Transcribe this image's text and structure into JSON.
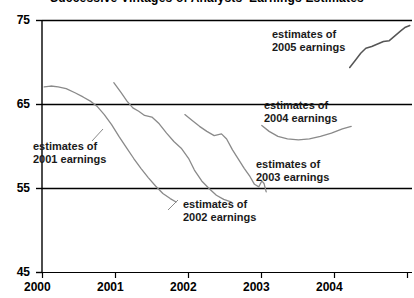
{
  "chart_data": {
    "type": "line",
    "title": "Successive Vintages of Analysts' Earnings Estimates",
    "xlabel": "",
    "ylabel": "",
    "xlim": [
      2000.0,
      2005.05
    ],
    "ylim": [
      45,
      75
    ],
    "y_ticks": [
      45,
      55,
      65,
      75
    ],
    "x_ticks": [
      "2000",
      "2001",
      "2002",
      "2003",
      "2004"
    ],
    "x_tick_values": [
      2000,
      2001,
      2002,
      2003,
      2004
    ],
    "grid": "horizontal gridlines at 55, 65, 75",
    "legend": "inline annotations",
    "series": [
      {
        "name": "estimates of 2001 earnings",
        "label": "estimates of\n2001 earnings",
        "points": [
          [
            2000.03,
            67.1
          ],
          [
            2000.12,
            67.2
          ],
          [
            2000.22,
            67.1
          ],
          [
            2000.33,
            66.9
          ],
          [
            2000.45,
            66.4
          ],
          [
            2000.56,
            65.9
          ],
          [
            2000.66,
            65.4
          ],
          [
            2000.75,
            64.8
          ],
          [
            2000.85,
            63.8
          ],
          [
            2000.95,
            62.6
          ],
          [
            2001.05,
            61.2
          ],
          [
            2001.15,
            59.9
          ],
          [
            2001.25,
            58.6
          ],
          [
            2001.35,
            57.4
          ],
          [
            2001.45,
            56.3
          ],
          [
            2001.55,
            55.3
          ],
          [
            2001.65,
            54.4
          ],
          [
            2001.75,
            53.8
          ],
          [
            2001.83,
            53.4
          ]
        ]
      },
      {
        "name": "estimates of 2002 earnings",
        "label": "estimates of\n2002 earnings",
        "points": [
          [
            2000.98,
            67.6
          ],
          [
            2001.08,
            66.4
          ],
          [
            2001.16,
            65.4
          ],
          [
            2001.24,
            64.6
          ],
          [
            2001.32,
            64.2
          ],
          [
            2001.4,
            63.7
          ],
          [
            2001.5,
            63.5
          ],
          [
            2001.6,
            62.7
          ],
          [
            2001.7,
            61.6
          ],
          [
            2001.8,
            60.6
          ],
          [
            2001.9,
            59.8
          ],
          [
            2002.0,
            58.6
          ],
          [
            2002.08,
            57.2
          ],
          [
            2002.18,
            55.9
          ],
          [
            2002.28,
            55.0
          ],
          [
            2002.38,
            54.2
          ],
          [
            2002.48,
            53.7
          ],
          [
            2002.58,
            53.4
          ]
        ]
      },
      {
        "name": "estimates of 2003 earnings",
        "label": "estimates of\n2003 earnings",
        "points": [
          [
            2001.95,
            63.8
          ],
          [
            2002.05,
            63.1
          ],
          [
            2002.15,
            62.4
          ],
          [
            2002.25,
            61.8
          ],
          [
            2002.35,
            61.3
          ],
          [
            2002.45,
            61.5
          ],
          [
            2002.52,
            60.9
          ],
          [
            2002.6,
            59.6
          ],
          [
            2002.68,
            58.5
          ],
          [
            2002.76,
            57.4
          ],
          [
            2002.84,
            56.4
          ],
          [
            2002.9,
            55.5
          ],
          [
            2002.96,
            55.2
          ],
          [
            2003.0,
            55.9
          ],
          [
            2003.03,
            55.6
          ],
          [
            2003.06,
            54.6
          ]
        ]
      },
      {
        "name": "estimates of 2004 earnings",
        "label": "estimates of\n2004 earnings",
        "points": [
          [
            2003.0,
            62.5
          ],
          [
            2003.1,
            61.8
          ],
          [
            2003.22,
            61.2
          ],
          [
            2003.35,
            60.9
          ],
          [
            2003.5,
            60.8
          ],
          [
            2003.65,
            60.9
          ],
          [
            2003.8,
            61.2
          ],
          [
            2003.95,
            61.6
          ],
          [
            2004.1,
            62.1
          ],
          [
            2004.22,
            62.4
          ]
        ]
      },
      {
        "name": "estimates of 2005 earnings",
        "label": "estimates of\n2005 earnings",
        "points": [
          [
            2004.2,
            69.4
          ],
          [
            2004.28,
            70.3
          ],
          [
            2004.35,
            71.1
          ],
          [
            2004.42,
            71.7
          ],
          [
            2004.5,
            71.9
          ],
          [
            2004.58,
            72.2
          ],
          [
            2004.66,
            72.5
          ],
          [
            2004.74,
            72.6
          ],
          [
            2004.82,
            73.2
          ],
          [
            2004.9,
            73.8
          ],
          [
            2004.96,
            74.2
          ],
          [
            2005.02,
            74.4
          ]
        ]
      }
    ],
    "annotations": [
      {
        "id": "ann-2001",
        "line1": "estimates of",
        "line2": "2001 earnings"
      },
      {
        "id": "ann-2002",
        "line1": "estimates of",
        "line2": "2002 earnings"
      },
      {
        "id": "ann-2003",
        "line1": "estimates of",
        "line2": "2003 earnings"
      },
      {
        "id": "ann-2004",
        "line1": "estimates of",
        "line2": "2004 earnings"
      },
      {
        "id": "ann-2005",
        "line1": "estimates of",
        "line2": "2005 earnings"
      }
    ],
    "colors": {
      "line": "#888888",
      "axis": "#000000",
      "text": "#1a1a1a",
      "background": "#ffffff"
    }
  },
  "axes": {
    "y_ticks": [
      {
        "label": "75"
      },
      {
        "label": "65"
      },
      {
        "label": "55"
      },
      {
        "label": "45"
      }
    ],
    "x_ticks": [
      {
        "label": "2000"
      },
      {
        "label": "2001"
      },
      {
        "label": "2002"
      },
      {
        "label": "2003"
      },
      {
        "label": "2004"
      }
    ]
  },
  "title": {
    "text": "Successive Vintages of Analysts' Earnings Estimates"
  }
}
